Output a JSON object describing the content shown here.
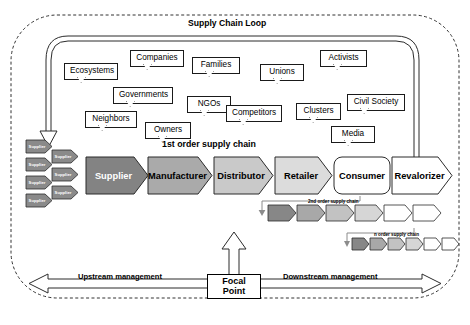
{
  "diagram": {
    "loop_title": "Supply Chain Loop",
    "first_order_label": "1st order supply chain",
    "second_order_label": "2nd order supply chain",
    "n_order_label": "n order supply chain",
    "focal_point": "Focal\nPoint",
    "focal_point_line1": "Focal",
    "focal_point_line2": "Point",
    "upstream_label": "Upstream management",
    "downstream_label": "Downstream management"
  },
  "stakeholders": [
    {
      "label": "Ecosystems",
      "x": 64,
      "y": 63,
      "w": 54
    },
    {
      "label": "Companies",
      "x": 130,
      "y": 50,
      "w": 54
    },
    {
      "label": "Families",
      "x": 192,
      "y": 57,
      "w": 48
    },
    {
      "label": "Unions",
      "x": 260,
      "y": 64,
      "w": 44
    },
    {
      "label": "Activists",
      "x": 320,
      "y": 50,
      "w": 47
    },
    {
      "label": "Governments",
      "x": 113,
      "y": 87,
      "w": 60
    },
    {
      "label": "NGOs",
      "x": 187,
      "y": 96,
      "w": 44
    },
    {
      "label": "Competitors",
      "x": 226,
      "y": 105,
      "w": 56
    },
    {
      "label": "Clusters",
      "x": 296,
      "y": 103,
      "w": 45
    },
    {
      "label": "Civil Society",
      "x": 347,
      "y": 94,
      "w": 58
    },
    {
      "label": "Neighbors",
      "x": 85,
      "y": 111,
      "w": 52
    },
    {
      "label": "Owners",
      "x": 145,
      "y": 122,
      "w": 46
    },
    {
      "label": "Media",
      "x": 331,
      "y": 126,
      "w": 44
    }
  ],
  "main_chain": [
    {
      "label": "Supplier",
      "x": 86,
      "w": 60,
      "fill": "#838383",
      "text": "#ffffff",
      "shape": "chevron"
    },
    {
      "label": "Manufacturer",
      "x": 148,
      "w": 64,
      "fill": "#aaaaaa",
      "text": "#000000",
      "shape": "chevron"
    },
    {
      "label": "Distributor",
      "x": 214,
      "w": 59,
      "fill": "#c9c9c9",
      "text": "#000000",
      "shape": "chevron"
    },
    {
      "label": "Retailer",
      "x": 275,
      "w": 57,
      "fill": "#dcdcdc",
      "text": "#000000",
      "shape": "chevron"
    },
    {
      "label": "Consumer",
      "x": 334,
      "w": 56,
      "fill": "#ffffff",
      "text": "#000000",
      "shape": "rounded"
    },
    {
      "label": "Revalorizer",
      "x": 392,
      "w": 60,
      "fill": "#ffffff",
      "text": "#000000",
      "shape": "chevron"
    }
  ],
  "mini_suppliers": [
    {
      "label": "Supplier",
      "x": 26,
      "y": 140
    },
    {
      "label": "Supplier",
      "x": 52,
      "y": 150
    },
    {
      "label": "Supplier",
      "x": 26,
      "y": 158
    },
    {
      "label": "Supplier",
      "x": 52,
      "y": 168
    },
    {
      "label": "Supplier",
      "x": 26,
      "y": 176
    },
    {
      "label": "Supplier",
      "x": 52,
      "y": 186
    },
    {
      "label": "Supplier",
      "x": 26,
      "y": 194
    }
  ],
  "second_order_chain": {
    "x": 268,
    "y": 205,
    "w": 28,
    "h": 16,
    "gap": 1,
    "fills": [
      "#878787",
      "#a8a8a8",
      "#c2c2c2",
      "#d6d6d6",
      "#ffffff",
      "#ffffff"
    ]
  },
  "n_order_chain": {
    "x": 352,
    "y": 238,
    "w": 17,
    "h": 12,
    "gap": 1,
    "fills": [
      "#878787",
      "#a8a8a8",
      "#c2c2c2",
      "#d6d6d6",
      "#ffffff",
      "#ffffff"
    ]
  },
  "colors": {
    "outline": "#1a1a1a",
    "dashed_border": "#333333",
    "connector": "#8c8c8c",
    "loop_arrow": "#2b2b2b"
  }
}
